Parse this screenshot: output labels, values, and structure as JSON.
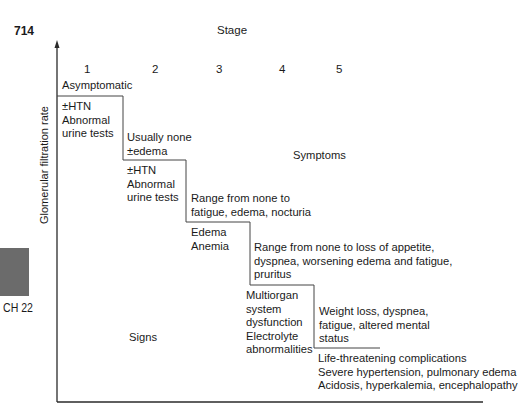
{
  "page": {
    "number": "714",
    "chapter_tab": "CH 22"
  },
  "diagram": {
    "title": "Stage",
    "y_axis_label": "Glomerular filtration rate",
    "stages": [
      "1",
      "2",
      "3",
      "4",
      "5"
    ],
    "region_labels": {
      "symptoms": "Symptoms",
      "signs": "Signs"
    },
    "steps": [
      {
        "stage": "1",
        "symptoms": [
          "Asymptomatic"
        ],
        "signs": [
          "±HTN",
          "Abnormal",
          "urine tests"
        ]
      },
      {
        "stage": "2",
        "symptoms": [
          "Usually none",
          "±edema"
        ],
        "signs": [
          "±HTN",
          "Abnormal",
          "urine tests"
        ]
      },
      {
        "stage": "3",
        "symptoms": [
          "Range from none to",
          "fatigue, edema, nocturia"
        ],
        "signs": [
          "Edema",
          "Anemia"
        ]
      },
      {
        "stage": "4",
        "symptoms": [
          "Range from none to loss of appetite,",
          "dyspnea, worsening edema and fatigue,",
          "pruritus"
        ],
        "signs": [
          "Multiorgan",
          "system",
          "dysfunction",
          "Electrolyte",
          "abnormalities"
        ]
      },
      {
        "stage": "5",
        "symptoms": [
          "Weight loss, dyspnea,",
          "fatigue, altered mental",
          "status"
        ],
        "signs": [
          "Life-threatening complications",
          "Severe hypertension, pulmonary edema",
          "Acidosis, hyperkalemia, encephalopathy"
        ]
      }
    ]
  },
  "colors": {
    "line": "#2a2a2a",
    "text": "#1a1a1a",
    "chapter_tab": "#6b6b6b"
  }
}
